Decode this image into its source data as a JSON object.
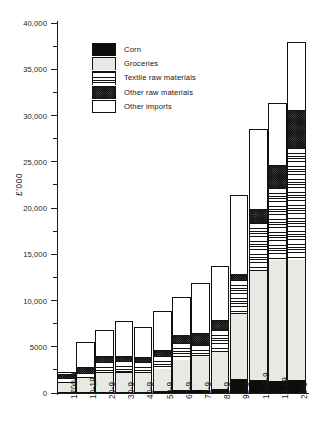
{
  "chart_data": {
    "type": "bar",
    "subtype": "stacked-bar",
    "title": "",
    "xlabel": "",
    "ylabel": "£'000",
    "ylim": [
      0,
      40000
    ],
    "ytick_labels": [
      "0",
      "5000",
      "10,000",
      "15,000",
      "20,000",
      "25,000",
      "30,000",
      "35,000",
      "40,000"
    ],
    "ytick_values": [
      0,
      5000,
      10000,
      15000,
      20000,
      25000,
      30000,
      35000,
      40000
    ],
    "minor_tick_interval": 2500,
    "grid": false,
    "legend_position": "upper-left",
    "categories": [
      "1700-9",
      "10-19",
      "20-9",
      "30-9",
      "40-9",
      "50-9",
      "60-9",
      "70-9",
      "80-9",
      "90-9",
      "1800-9",
      "10-19",
      "20-9"
    ],
    "series": [
      {
        "name": "Corn",
        "fill": "solid-black",
        "values": [
          100,
          150,
          150,
          120,
          120,
          200,
          300,
          350,
          400,
          1500,
          1400,
          1350,
          1450
        ]
      },
      {
        "name": "Groceries",
        "fill": "light-stipple",
        "values": [
          1100,
          1550,
          2050,
          2150,
          2080,
          2450,
          3300,
          3750,
          4050,
          7100,
          11900,
          13050,
          12950
        ]
      },
      {
        "name": "Textile raw materials",
        "fill": "horizontal-lines",
        "values": [
          450,
          500,
          1200,
          1200,
          1200,
          1350,
          1800,
          1050,
          2400,
          3600,
          5100,
          7750,
          12100
        ]
      },
      {
        "name": "Other raw materials",
        "fill": "dark-stipple",
        "values": [
          450,
          600,
          550,
          500,
          500,
          650,
          900,
          1300,
          1050,
          700,
          1500,
          2450,
          4050
        ]
      },
      {
        "name": "Other imports",
        "fill": "white",
        "values": [
          200,
          2700,
          2900,
          3800,
          3200,
          4200,
          4100,
          5450,
          5800,
          8500,
          8600,
          6800,
          7450
        ]
      }
    ],
    "totals": [
      2300,
      5500,
      6850,
      7770,
      7100,
      8850,
      10400,
      11900,
      13700,
      21400,
      28500,
      31400,
      38000
    ]
  },
  "legend": {
    "items": [
      {
        "label": "Corn"
      },
      {
        "label": "Groceries"
      },
      {
        "label": "Textile raw materials"
      },
      {
        "label": "Other raw materials"
      },
      {
        "label": "Other imports"
      }
    ]
  }
}
